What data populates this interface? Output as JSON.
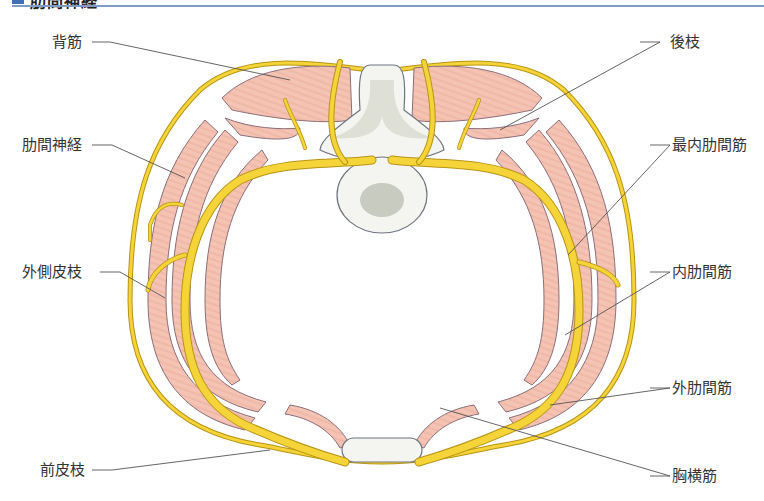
{
  "header": {
    "title": "肋間神経",
    "accent_color": "#3f6fb5",
    "rule_color": "#7f9cc4"
  },
  "diagram": {
    "colors": {
      "nerve": "#f5d43a",
      "nerve_outline": "#b89414",
      "muscle": "#f4c3b3",
      "muscle_outline": "#8a6f7a",
      "bone_fill": "#f4f4f0",
      "bone_shade": "#c8cbbf",
      "outline": "#6e7480",
      "leader_line": "#555555"
    },
    "labels": {
      "left": [
        {
          "id": "back-muscle",
          "text": "背筋"
        },
        {
          "id": "intercostal-nerve",
          "text": "肋間神経"
        },
        {
          "id": "lateral-cutaneous-branch",
          "text": "外側皮枝"
        },
        {
          "id": "anterior-cutaneous-branch",
          "text": "前皮枝"
        }
      ],
      "right": [
        {
          "id": "posterior-branch",
          "text": "後枝"
        },
        {
          "id": "innermost-intercostal-muscle",
          "text": "最内肋間筋"
        },
        {
          "id": "internal-intercostal-muscle",
          "text": "内肋間筋"
        },
        {
          "id": "external-intercostal-muscle",
          "text": "外肋間筋"
        },
        {
          "id": "transversus-thoracis-muscle",
          "text": "胸横筋"
        }
      ]
    }
  }
}
